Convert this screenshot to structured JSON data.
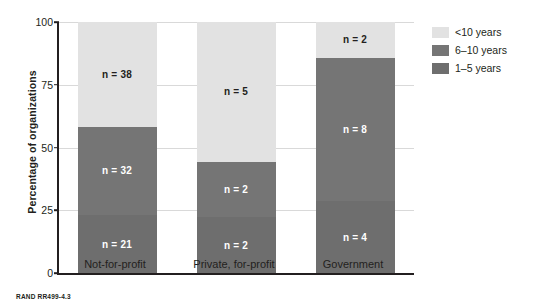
{
  "chart_data": {
    "type": "bar",
    "subtype": "stacked-percentage",
    "title": "",
    "xlabel": "",
    "ylabel": "Percentage of organizations",
    "ylim": [
      0,
      100
    ],
    "yticks": [
      0,
      25,
      50,
      75,
      100
    ],
    "grid": true,
    "legend_position": "right",
    "categories": [
      "Not-for-profit",
      "Private, for-profit",
      "Government"
    ],
    "series": [
      {
        "name": "1–5 years",
        "color": "#6e6e6e",
        "counts": [
          21,
          2,
          4
        ],
        "values": [
          23.1,
          22.2,
          28.6
        ],
        "labels": [
          "n = 21",
          "n = 2",
          "n = 4"
        ]
      },
      {
        "name": "6–10 years",
        "color": "#757575",
        "counts": [
          32,
          2,
          8
        ],
        "values": [
          35.2,
          22.2,
          57.1
        ],
        "labels": [
          "n = 32",
          "n = 2",
          "n = 8"
        ]
      },
      {
        "name": "<10 years",
        "color": "#e2e2e2",
        "counts": [
          38,
          5,
          2
        ],
        "values": [
          41.8,
          55.6,
          14.3
        ],
        "labels": [
          "n = 38",
          "n = 5",
          "n = 2"
        ]
      }
    ],
    "totals": [
      91,
      9,
      14
    ]
  },
  "legend": {
    "items": [
      {
        "label": "<10 years",
        "color": "#e2e2e2"
      },
      {
        "label": "6–10 years",
        "color": "#757575"
      },
      {
        "label": "1–5 years",
        "color": "#6e6e6e"
      }
    ]
  },
  "axis": {
    "y_title": "Percentage of organizations",
    "y_tick_labels": [
      "100",
      "75",
      "50",
      "25",
      "0"
    ]
  },
  "footer": {
    "source_id": "RAND RR499-4.3"
  }
}
